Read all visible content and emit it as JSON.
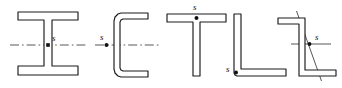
{
  "figure": {
    "name": "shear-center-cross-sections",
    "width": 342,
    "height": 88,
    "background_color": "#ffffff",
    "line_color": "#1a1a1a",
    "axis_color": "#3a3a3a",
    "label_color": "#111111"
  },
  "sections": [
    {
      "id": "i-beam",
      "name": "i-beam-section",
      "shape": "I",
      "label": "s",
      "label_position": "right-of-centroid-on-web",
      "centroid": {
        "x": 48,
        "y": 45
      },
      "label_xy": {
        "x": 52,
        "y": 41
      },
      "axis": {
        "type": "dash-dot",
        "x1": 10,
        "y1": 45,
        "x2": 88,
        "y2": 45
      },
      "outline": "M18,12 L78,12 L78,20 L52,20 L52,66 L78,66 L78,75 L18,75 L18,66 L44,66 L44,20 L18,20 Z"
    },
    {
      "id": "c-channel",
      "name": "c-channel-section",
      "shape": "C",
      "label": "s",
      "label_position": "left-of-web",
      "centroid": {
        "x": 106,
        "y": 45
      },
      "label_xy": {
        "x": 101,
        "y": 41
      },
      "axis": {
        "type": "dash-dot",
        "x1": 95,
        "y1": 45,
        "x2": 160,
        "y2": 45
      },
      "outline": "M148,13 L121,13 L118,14 L115,17 L114,21 L114,69 L115,73 L118,76 L121,77 L148,77 L148,71 L123,71 L121,70 L120,68 L120,22 L121,20 L123,19 L148,19 Z"
    },
    {
      "id": "t-section",
      "name": "t-section",
      "shape": "T",
      "label": "s",
      "label_position": "above-flange-at-junction",
      "centroid": {
        "x": 196,
        "y": 18
      },
      "label_xy": {
        "x": 193,
        "y": 10
      },
      "axis": {
        "type": "none"
      },
      "outline": "M167,14 L226,14 L226,22 L200,22 L200,76 L193,76 L193,22 L167,22 Z"
    },
    {
      "id": "l-angle",
      "name": "l-angle-section",
      "shape": "L",
      "label": "s",
      "label_position": "at-heel-corner",
      "centroid": {
        "x": 234,
        "y": 73
      },
      "label_xy": {
        "x": 226,
        "y": 71
      },
      "axis": {
        "type": "none"
      },
      "outline": "M234,14 L241,14 L241,69 L286,69 L286,76 L237,76 L235,75 L234,73 Z"
    },
    {
      "id": "z-section",
      "name": "z-section",
      "shape": "Z",
      "label": "s",
      "label_position": "right-of-centroid",
      "centroid": {
        "x": 310,
        "y": 44
      },
      "label_xy": {
        "x": 315,
        "y": 40
      },
      "axis": {
        "type": "principal-axes"
      },
      "axis_horizontal": {
        "x1": 292,
        "y1": 44,
        "x2": 330,
        "y2": 44
      },
      "axis_diagonal": {
        "x1": 296,
        "y1": 12,
        "x2": 322,
        "y2": 80
      },
      "outline": "M278,18 L305,18 L305,70 L336,70 L336,76 L299,76 L299,24 L278,24 Z"
    }
  ]
}
